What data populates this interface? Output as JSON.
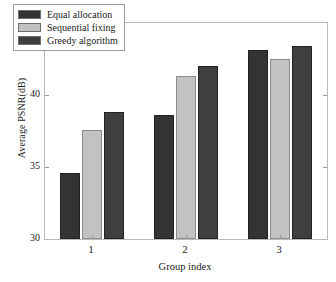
{
  "chart_data": {
    "type": "bar",
    "title": "",
    "xlabel": "Group index",
    "ylabel": "Average PSNR(dB)",
    "categories": [
      "1",
      "2",
      "3"
    ],
    "series": [
      {
        "name": "Equal allocation",
        "color": "#333333",
        "values": [
          34.6,
          38.6,
          43.1
        ]
      },
      {
        "name": "Sequential fixing",
        "color": "#c2c2c2",
        "values": [
          37.6,
          41.3,
          42.5
        ]
      },
      {
        "name": "Greedy algorithm",
        "color": "#3f3f3f",
        "values": [
          38.8,
          42.0,
          43.4
        ]
      }
    ],
    "ylim": [
      30,
      45
    ],
    "yticks": [
      "30",
      "35",
      "40",
      "45"
    ],
    "ytick_values": [
      30,
      35,
      40,
      45
    ],
    "xticks": [
      "1",
      "2",
      "3"
    ],
    "grid": false,
    "legend_position": "top-left",
    "axis_color": "#b9b9b9",
    "background": "#ffffff"
  }
}
